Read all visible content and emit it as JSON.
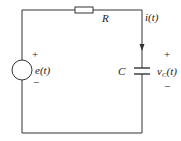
{
  "diagram": {
    "type": "RC series circuit",
    "resistor": {
      "label": "R"
    },
    "capacitor": {
      "label": "C",
      "voltage_label": "v",
      "voltage_subscript": "C",
      "voltage_arg": "(t)"
    },
    "source": {
      "label": "e(t)",
      "plus": "+",
      "minus": "−"
    },
    "current": {
      "label": "i(t)"
    },
    "cap_plus": "+",
    "cap_minus": "−"
  }
}
